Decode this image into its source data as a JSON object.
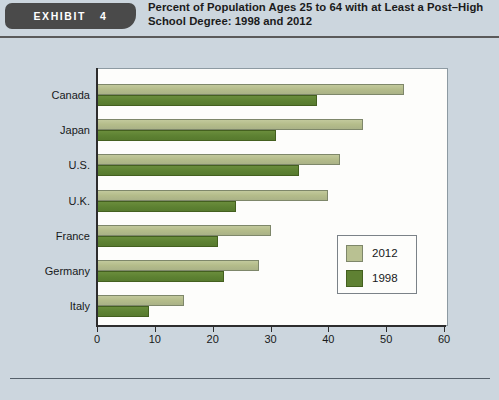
{
  "header": {
    "exhibit_word": "EXHIBIT",
    "exhibit_number": "4",
    "title": "Percent of Population Ages 25 to 64 with at Least a Post–High School Degree: 1998 and 2012"
  },
  "colors": {
    "page_background": "#ccd6de",
    "plot_background": "#fdfdfb",
    "series_2012": "#b9c192",
    "series_1998": "#5f8133",
    "axis": "#2d2d2d",
    "exhibit_tag": "#4a4a4a"
  },
  "legend": {
    "position": "inside-right",
    "entries": [
      {
        "label": "2012",
        "color": "#b9c192"
      },
      {
        "label": "1998",
        "color": "#5f8133"
      }
    ]
  },
  "chart_data": {
    "type": "bar",
    "orientation": "horizontal",
    "title": "Percent of Population Ages 25 to 64 with at Least a Post–High School Degree: 1998 and 2012",
    "xlabel": "",
    "ylabel": "",
    "xlim": [
      0,
      60
    ],
    "xticks": [
      0,
      10,
      20,
      30,
      40,
      50,
      60
    ],
    "grid": false,
    "categories": [
      "Canada",
      "Japan",
      "U.S.",
      "U.K.",
      "France",
      "Germany",
      "Italy"
    ],
    "series": [
      {
        "name": "2012",
        "color": "#b9c192",
        "values": [
          53,
          46,
          42,
          40,
          30,
          28,
          15
        ]
      },
      {
        "name": "1998",
        "color": "#5f8133",
        "values": [
          38,
          31,
          35,
          24,
          21,
          22,
          9
        ]
      }
    ]
  }
}
